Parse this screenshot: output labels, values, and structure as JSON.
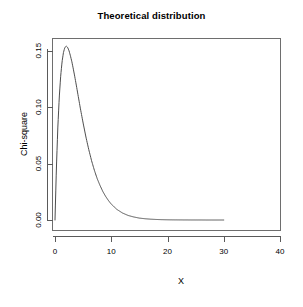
{
  "chart_data": {
    "type": "line",
    "title": "Theoretical distribution",
    "xlabel": "X",
    "ylabel": "Chi-square",
    "xlim": [
      0,
      40
    ],
    "ylim": [
      0,
      0.155
    ],
    "grid": false,
    "legend": null,
    "xticks": [
      "0",
      "10",
      "20",
      "30",
      "40"
    ],
    "xtick_values": [
      0,
      10,
      20,
      30,
      40
    ],
    "yticks": [
      "0.00",
      "0.05",
      "0.10",
      "0.15"
    ],
    "ytick_values": [
      0.0,
      0.05,
      0.1,
      0.15
    ],
    "series": [
      {
        "name": "Chi-square density (df = 4)",
        "color": "#4d4d4d",
        "x": [
          0.0,
          0.25,
          0.5,
          0.75,
          1.0,
          1.25,
          1.5,
          1.75,
          2.0,
          2.25,
          2.5,
          2.75,
          3.0,
          3.25,
          3.5,
          3.75,
          4.0,
          4.5,
          5.0,
          5.5,
          6.0,
          6.5,
          7.0,
          7.5,
          8.0,
          8.5,
          9.0,
          9.5,
          10.0,
          11.0,
          12.0,
          13.0,
          14.0,
          15.0,
          16.0,
          17.0,
          18.0,
          19.0,
          20.0,
          21.0,
          22.0,
          23.0,
          24.0,
          25.0,
          26.0,
          27.0,
          28.0,
          29.0,
          30.0
        ],
        "y": [
          0.0,
          0.0277,
          0.0487,
          0.0645,
          0.0758,
          0.0836,
          0.0886,
          0.0913,
          0.092,
          0.0913,
          0.0895,
          0.0868,
          0.0837,
          0.08,
          0.0761,
          0.072,
          0.0677,
          0.0592,
          0.0513,
          0.0439,
          0.0373,
          0.0314,
          0.0263,
          0.0219,
          0.0183,
          0.0151,
          0.0125,
          0.0103,
          0.0084,
          0.0056,
          0.0037,
          0.0024,
          0.0016,
          0.001,
          0.00067,
          0.00043,
          0.00028,
          0.00018,
          0.00011,
          7e-05,
          5e-05,
          3e-05,
          2e-05,
          1e-05,
          1e-05,
          0.0,
          0.0,
          0.0,
          0.0
        ],
        "peak_x": 2.7,
        "peak_y": 0.154,
        "x_drawn_max": 30
      }
    ]
  }
}
